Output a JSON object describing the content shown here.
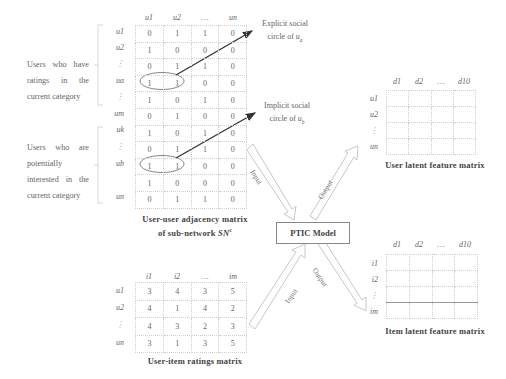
{
  "left_labels": {
    "group_a": "Users who have ratings in the current category",
    "group_b": "Users who are potentially interested in the current category"
  },
  "adjacency_matrix": {
    "col_headers": [
      "u1",
      "u2",
      "…",
      "un"
    ],
    "row_headers": [
      "u1",
      "u2",
      "⋮",
      "ua",
      "⋮",
      "um",
      "uk",
      "⋮",
      "ub",
      "",
      "un"
    ],
    "rows": [
      [
        "0",
        "1",
        "1",
        "0"
      ],
      [
        "1",
        "0",
        "0",
        "0"
      ],
      [
        "0",
        "1",
        "1",
        "0"
      ],
      [
        "1",
        "1",
        "0",
        "0"
      ],
      [
        "1",
        "0",
        "1",
        "0"
      ],
      [
        "0",
        "1",
        "0",
        "0"
      ],
      [
        "1",
        "0",
        "1",
        "0"
      ],
      [
        "0",
        "1",
        "1",
        "0"
      ],
      [
        "1",
        "1",
        "0",
        "0"
      ],
      [
        "1",
        "0",
        "0",
        "0"
      ],
      [
        "0",
        "1",
        "1",
        "0"
      ]
    ],
    "caption_line1": "User-user adjacency matrix",
    "caption_line2": "of sub-network",
    "caption_symbol": "SN",
    "caption_sup": "c"
  },
  "annotations": {
    "explicit_line1": "Explicit social",
    "explicit_line2": "circle of",
    "explicit_var": "u",
    "explicit_sub": "a",
    "implicit_line1": "Implicit social",
    "implicit_line2": "circle of",
    "implicit_var": "u",
    "implicit_sub": "b"
  },
  "ratings_matrix": {
    "col_headers": [
      "i1",
      "i2",
      "…",
      "im"
    ],
    "row_headers": [
      "u1",
      "u2",
      "⋮",
      "un"
    ],
    "rows": [
      [
        "3",
        "4",
        "3",
        "5"
      ],
      [
        "4",
        "1",
        "4",
        "2"
      ],
      [
        "4",
        "3",
        "2",
        "3"
      ],
      [
        "3",
        "1",
        "3",
        "5"
      ]
    ],
    "caption": "User-item ratings matrix"
  },
  "model": {
    "label": "PTIC Model",
    "input_label": "Input",
    "output_label": "Output"
  },
  "user_latent": {
    "col_headers": [
      "d1",
      "d2",
      "…",
      "d10"
    ],
    "row_headers": [
      "u1",
      "u2",
      "⋮",
      "un"
    ],
    "caption": "User latent feature matrix"
  },
  "item_latent": {
    "col_headers": [
      "d1",
      "d2",
      "…",
      "d10"
    ],
    "row_headers": [
      "i1",
      "i2",
      "⋮",
      "im"
    ],
    "caption": "Item latent feature matrix"
  },
  "colors": {
    "text": "#555555",
    "grid": "#cfcfcf",
    "arrow": "#333333",
    "hollow_arrow": "#c8c8c8"
  }
}
